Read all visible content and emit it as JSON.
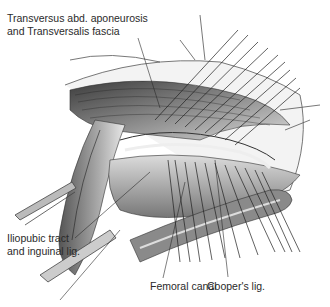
{
  "figure": {
    "type": "anatomical surgical illustration",
    "labels": [
      {
        "id": "transversus",
        "lines": [
          "Transversus abd. aponeurosis",
          "and Transversalis fascia"
        ]
      },
      {
        "id": "iliopubic",
        "lines": [
          "Iliopubic tract",
          "and inguinal lig."
        ]
      },
      {
        "id": "femoral",
        "lines": [
          "Femoral canal"
        ]
      },
      {
        "id": "coopers",
        "lines": [
          "Cooper's lig."
        ]
      }
    ],
    "colors": {
      "background": "#ffffff",
      "ink": "#2a2a2a",
      "shading_dark": "#4a4a4a",
      "shading_mid": "#8a8a8a",
      "shading_light": "#cfcfcf"
    }
  }
}
